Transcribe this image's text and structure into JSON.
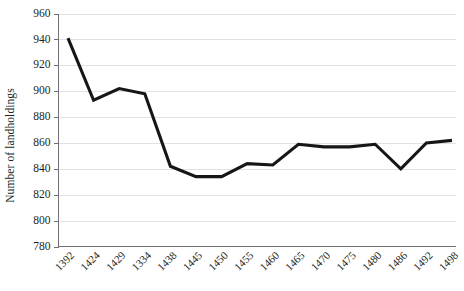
{
  "chart_data": {
    "type": "line",
    "title": "",
    "subtitle": "",
    "xlabel": "",
    "ylabel": "Number of landholdings",
    "categories": [
      "1392",
      "1424",
      "1429",
      "1334",
      "1438",
      "1445",
      "1450",
      "1455",
      "1460",
      "1465",
      "1470",
      "1475",
      "1480",
      "1486",
      "1492",
      "1498"
    ],
    "values": [
      941,
      893,
      902,
      898,
      842,
      834,
      834,
      844,
      843,
      859,
      857,
      857,
      859,
      840,
      860,
      862
    ],
    "series": [
      {
        "name": "Number of landholdings",
        "values": [
          941,
          893,
          902,
          898,
          842,
          834,
          834,
          844,
          843,
          859,
          857,
          857,
          859,
          840,
          860,
          862
        ]
      }
    ],
    "ylim": [
      780,
      960
    ],
    "yticks": [
      780,
      800,
      820,
      840,
      860,
      880,
      900,
      920,
      940,
      960
    ],
    "ytick_labels": [
      "780",
      "800",
      "820",
      "840",
      "860",
      "880",
      "900",
      "920",
      "940",
      "960"
    ],
    "grid": "horizontal",
    "legend": "none",
    "markers": "none",
    "annotations": [],
    "colors": {
      "line": "#161616",
      "gridline": "#e2e2e4",
      "axis": "#6e6e72",
      "text": "#231f20",
      "background": "#ffffff"
    },
    "line_width_px": 3,
    "xtick_label_rotation_deg": -45
  }
}
